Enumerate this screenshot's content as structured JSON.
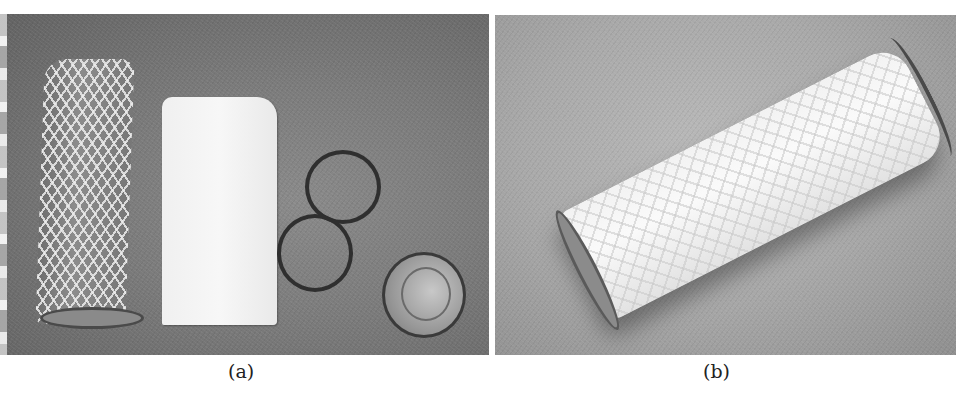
{
  "figure": {
    "panels": [
      {
        "label": "(a)",
        "description": "Disassembled filter components: cylindrical metal mesh tube, white filter cloth sheet, two black O-rings, and a transparent end cap on a gray surface"
      },
      {
        "label": "(b)",
        "description": "Assembled filter: mesh tube wrapped in white filter cloth with rims at both ends, lying diagonally on a gray surface"
      }
    ]
  }
}
